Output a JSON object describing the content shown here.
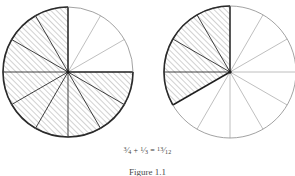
{
  "figure": {
    "caption": "Figure 1.1",
    "background_color": "#ffffff",
    "equation": {
      "left_fraction": {
        "numerator": "3",
        "denominator": "4",
        "solidus": "⁄"
      },
      "plus_operator": "+",
      "right_fraction": {
        "numerator": "1",
        "denominator": "3",
        "solidus": "⁄"
      },
      "equals_operator": "=",
      "result_fraction": {
        "numerator": "13",
        "denominator": "12",
        "solidus": "⁄"
      },
      "plain_text": "3/4 + 1/3 = 13/12"
    },
    "colors": {
      "outline": "#2b2b2b",
      "thin_spoke": "#8a8a8a",
      "thick_spoke": "#1f1f1f",
      "hatch": "#9a9a9a",
      "text": "#3b3b3b"
    },
    "circles": [
      {
        "name": "left-circle",
        "label": "three-quarters",
        "fraction_text": "3/4",
        "center_x": 68,
        "center_y": 72,
        "radius": 65,
        "total_sectors": 12,
        "shaded_sectors": 9,
        "sector_degrees": 30,
        "shaded_start_degrees": 0,
        "shaded_sweep_degrees": 270,
        "shaded_indices": [
          3,
          4,
          5,
          6,
          7,
          8,
          9,
          10,
          11
        ],
        "unshaded_indices": [
          0,
          1,
          2
        ]
      },
      {
        "name": "right-circle",
        "label": "one-third",
        "fraction_text": "1/3",
        "center_x": 230,
        "center_y": 72,
        "radius": 66,
        "total_sectors": 12,
        "shaded_sectors": 4,
        "sector_degrees": 30,
        "shaded_start_degrees": 90,
        "shaded_sweep_degrees": 120,
        "shaded_indices": [
          3,
          4,
          5,
          6
        ],
        "unshaded_indices": [
          0,
          1,
          2,
          7,
          8,
          9,
          10,
          11
        ]
      }
    ]
  }
}
